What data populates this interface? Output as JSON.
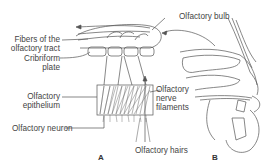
{
  "diagram": {
    "panels": [
      {
        "id": "A",
        "label": "A",
        "description": "Olfactory epithelium and bulb detail"
      },
      {
        "id": "B",
        "label": "B",
        "description": "Sagittal section of nasal cavity"
      }
    ],
    "labels": {
      "olfactory_bulb": "Olfactory bulb",
      "fibers_line1": "Fibers of the",
      "fibers_line2": "olfactory tract",
      "cribriform_line1": "Cribriform",
      "cribriform_line2": "plate",
      "epithelium_line1": "Olfactory",
      "epithelium_line2": "epithelium",
      "neuron": "Olfactory neuron",
      "nerve_line1": "Olfactory",
      "nerve_line2": "nerve",
      "nerve_line3": "filaments",
      "hairs": "Olfactory hairs"
    },
    "colors": {
      "line": "#555555",
      "background": "#ffffff",
      "text": "#444444"
    }
  }
}
